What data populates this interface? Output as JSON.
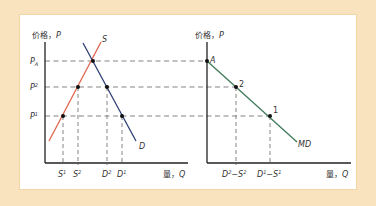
{
  "colors": {
    "background": "#f9e3bf",
    "panel": "#ffffff",
    "axis": "#222222",
    "dash": "#666666",
    "supply": "#e2644f",
    "demand": "#2e3f74",
    "import_demand": "#3f7a5a"
  },
  "left_chart": {
    "y_axis_label": "价格，",
    "y_axis_var": "P",
    "x_axis_label": "量，",
    "x_axis_var": "Q",
    "price_levels": [
      {
        "name": "P",
        "sup": "A",
        "id": "PA"
      },
      {
        "name": "P",
        "sup": "2",
        "id": "P2"
      },
      {
        "name": "P",
        "sup": "1",
        "id": "P1"
      }
    ],
    "quantity_ticks": [
      {
        "name": "S",
        "sup": "1"
      },
      {
        "name": "S",
        "sup": "2"
      },
      {
        "name": "D",
        "sup": "2"
      },
      {
        "name": "D",
        "sup": "1"
      }
    ],
    "supply_label": "S",
    "demand_label": "D"
  },
  "right_chart": {
    "y_axis_label": "价格，",
    "y_axis_var": "P",
    "x_axis_label": "量，",
    "x_axis_var": "Q",
    "points": [
      {
        "label": "A"
      },
      {
        "label": "2"
      },
      {
        "label": "1"
      }
    ],
    "quantity_ticks": [
      {
        "a": "D",
        "a_sup": "2",
        "b": "S",
        "b_sup": "2"
      },
      {
        "a": "D",
        "a_sup": "1",
        "b": "S",
        "b_sup": "1"
      }
    ],
    "curve_label": "MD"
  }
}
